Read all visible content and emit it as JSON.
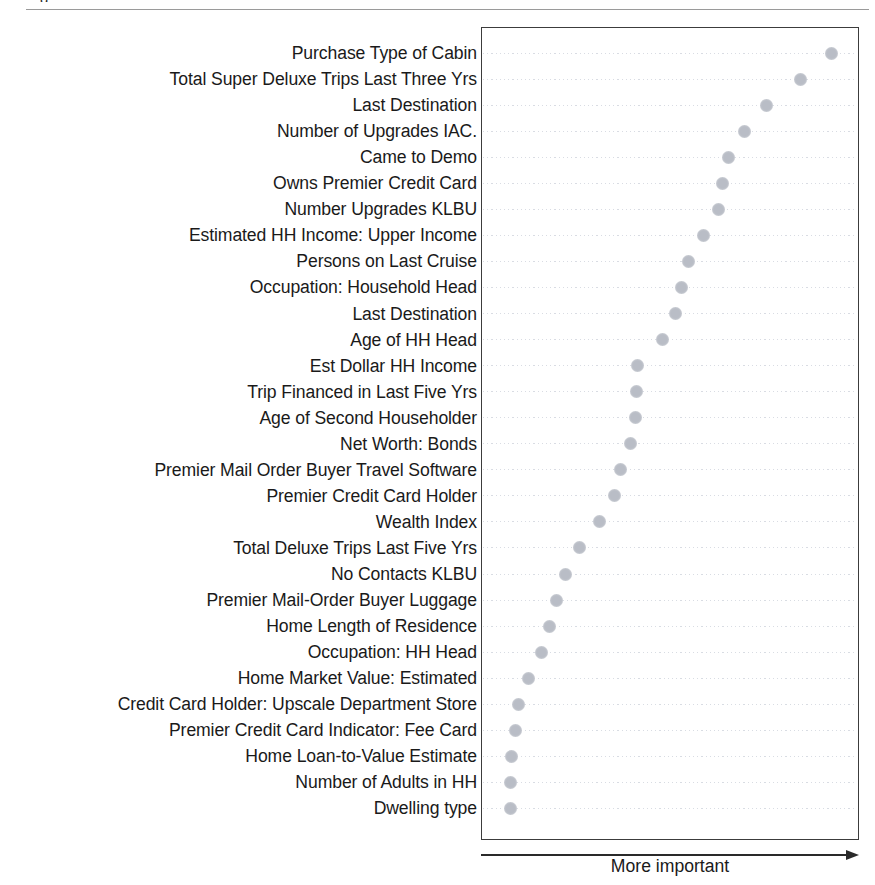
{
  "page": {
    "top_cropped_text_fragment": "g",
    "background_color": "#ffffff"
  },
  "chart": {
    "frame_border_color": "#3c3c3c",
    "dot_color": "#b9bdc6",
    "gridline_color": "#d2d6de",
    "x_axis_caption": "More important"
  },
  "chart_data": {
    "type": "scatter",
    "title": "",
    "subtitle": "",
    "xlabel": "More important",
    "ylabel": "",
    "orientation": "horizontal",
    "grid": true,
    "legend": null,
    "x_axis": {
      "ticks_shown": false,
      "tick_labels": [],
      "annotation": "More important",
      "arrow_direction": "right",
      "note": "Unlabeled importance axis; values below are relative importance estimated from dot x-positions, normalized 0-100 across the plot width."
    },
    "categories": [
      "Purchase Type of Cabin",
      "Total Super Deluxe Trips Last Three Yrs",
      "Last Destination",
      "Number of Upgrades IAC.",
      "Came to Demo",
      "Owns Premier Credit Card",
      "Number Upgrades KLBU",
      "Estimated HH Income: Upper Income",
      "Persons on Last Cruise",
      "Occupation: Household Head",
      "Last Destination",
      "Age of HH Head",
      "Est Dollar HH Income",
      "Trip Financed in Last Five Yrs",
      "Age of Second Householder",
      "Net Worth: Bonds",
      "Premier Mail Order Buyer Travel Software",
      "Premier Credit Card Holder",
      "Wealth Index",
      "Total Deluxe Trips Last Five Yrs",
      "No Contacts KLBU",
      "Premier Mail-Order Buyer Luggage",
      "Home Length of Residence",
      "Occupation: HH Head",
      "Home Market Value: Estimated",
      "Credit Card Holder: Upscale Department Store",
      "Premier Credit Card Indicator: Fee Card",
      "Home Loan-to-Value Estimate",
      "Number of Adults in HH",
      "Dwelling type"
    ],
    "values": [
      96.8,
      87.6,
      77.8,
      71.4,
      66.9,
      65.3,
      64.0,
      59.8,
      55.3,
      53.4,
      51.5,
      47.9,
      40.5,
      40.2,
      39.9,
      38.6,
      35.7,
      34.1,
      29.6,
      23.9,
      19.8,
      17.2,
      15.1,
      13.0,
      9.0,
      6.1,
      5.3,
      4.2,
      4.0,
      3.8
    ],
    "xlim": [
      0,
      100
    ],
    "ylim": null
  }
}
